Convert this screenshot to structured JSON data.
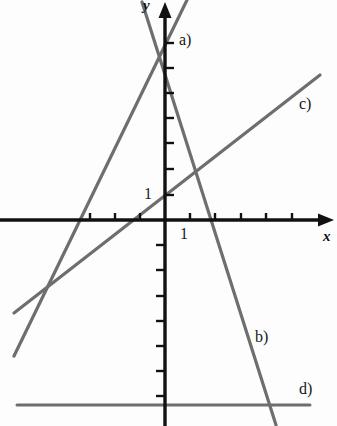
{
  "figure": {
    "background_color": "#fdfdfd",
    "axis_color": "#111111",
    "line_color": "#6e6e6e"
  },
  "axes": {
    "x_axis_label": "x",
    "y_axis_label": "y",
    "x_tick_label": "1",
    "y_tick_label": "1",
    "origin_px": {
      "x": 165,
      "y": 220
    },
    "unit_px": 25,
    "x_ticks_units": [
      -3,
      -2,
      -1,
      1,
      2,
      3,
      4,
      5
    ],
    "y_ticks_units": [
      1,
      2,
      3,
      4,
      5,
      6,
      7
    ],
    "x_range_units": [
      -6.0,
      6.7
    ],
    "y_range_units": [
      -8.2,
      8.8
    ],
    "grid": false
  },
  "labels": {
    "line_a": "a)",
    "line_b": "b)",
    "line_c": "c)",
    "line_d": "d)"
  },
  "chart_data": {
    "type": "line",
    "xlabel": "x",
    "ylabel": "y",
    "xlim": [
      -6.0,
      6.7
    ],
    "ylim": [
      -8.2,
      8.8
    ],
    "grid": false,
    "legend": "inline-labels",
    "unit_px": 25,
    "origin_px": {
      "x": 165,
      "y": 220
    },
    "series": [
      {
        "name": "a)",
        "label": "a)",
        "kind": "line",
        "slope": 2.06,
        "y_intercept": 7.0,
        "x_intercept": -3.4,
        "endpoints_px": [
          {
            "x": 14,
            "y": 356
          },
          {
            "x": 187,
            "y": 0
          }
        ],
        "endpoints_units": [
          {
            "x": -6.04,
            "y": -5.44
          },
          {
            "x": 0.88,
            "y": 8.8
          }
        ]
      },
      {
        "name": "b)",
        "label": "b)",
        "kind": "line",
        "slope": -3.16,
        "y_intercept": 5.8,
        "x_intercept": 1.84,
        "endpoints_px": [
          {
            "x": 142,
            "y": 2
          },
          {
            "x": 276,
            "y": 425
          }
        ],
        "endpoints_units": [
          {
            "x": -0.92,
            "y": 8.72
          },
          {
            "x": 4.44,
            "y": -8.2
          }
        ]
      },
      {
        "name": "c)",
        "label": "c)",
        "kind": "line",
        "slope": 0.78,
        "y_intercept": 1.0,
        "x_intercept": -1.29,
        "endpoints_px": [
          {
            "x": 14,
            "y": 313
          },
          {
            "x": 320,
            "y": 75
          }
        ],
        "endpoints_units": [
          {
            "x": -6.04,
            "y": -3.72
          },
          {
            "x": 6.2,
            "y": 5.8
          }
        ]
      },
      {
        "name": "d)",
        "label": "d)",
        "kind": "line",
        "slope": 0,
        "y_intercept": -7.4,
        "x_intercept": null,
        "endpoints_px": [
          {
            "x": 17,
            "y": 405
          },
          {
            "x": 310,
            "y": 405
          }
        ],
        "endpoints_units": [
          {
            "x": -5.92,
            "y": -7.4
          },
          {
            "x": 5.8,
            "y": -7.4
          }
        ]
      }
    ]
  }
}
